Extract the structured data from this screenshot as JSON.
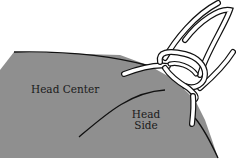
{
  "diagram": {
    "labels": {
      "head_center": "Head Center",
      "head_side_line1": "Head",
      "head_side_line2": "Side"
    },
    "colors": {
      "shape_fill": "#8f8f8f",
      "outline": "#111111",
      "cord_fill": "#ffffff",
      "background": "#ffffff"
    }
  }
}
